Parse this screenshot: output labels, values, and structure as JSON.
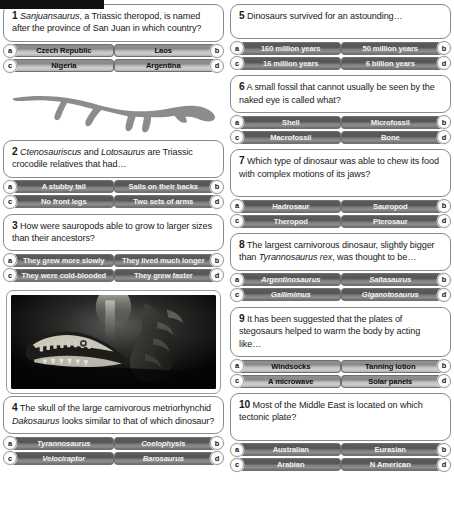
{
  "meta": {
    "accent_dark": "#5c5c5c",
    "accent_light": "#b3b3b3",
    "card_border": "#8a8a8a",
    "silhouette_color": "#8c8c8c"
  },
  "media": {
    "silhouette_alt": "dinosaur-silhouette",
    "photo_alt": "marine-reptile-skull-photo"
  },
  "columns": [
    {
      "id": "left",
      "items": [
        {
          "kind": "question",
          "number": "1",
          "text_parts": [
            {
              "t": "Sanjuansaurus",
              "i": true
            },
            {
              "t": ", a Triassic theropod, is named after the province of San Juan in which country?",
              "i": false
            }
          ],
          "style": "light",
          "answers": [
            {
              "key": "a",
              "label": "Czech Republic"
            },
            {
              "key": "b",
              "label": "Laos"
            },
            {
              "key": "c",
              "label": "Nigeria"
            },
            {
              "key": "d",
              "label": "Argentina"
            }
          ]
        },
        {
          "kind": "silhouette"
        },
        {
          "kind": "question",
          "number": "2",
          "text_parts": [
            {
              "t": "Ctenosauriscus",
              "i": true
            },
            {
              "t": " and ",
              "i": false
            },
            {
              "t": "Lotosaurus",
              "i": true
            },
            {
              "t": " are Triassic crocodile relatives that had…",
              "i": false
            }
          ],
          "style": "dark",
          "answers": [
            {
              "key": "a",
              "label": "A stubby tail"
            },
            {
              "key": "b",
              "label": "Sails on their backs"
            },
            {
              "key": "c",
              "label": "No front legs"
            },
            {
              "key": "d",
              "label": "Two sets of arms"
            }
          ]
        },
        {
          "kind": "question",
          "number": "3",
          "text_parts": [
            {
              "t": "How were sauropods able to grow to larger sizes than their ancestors?",
              "i": false
            }
          ],
          "style": "dark",
          "answers": [
            {
              "key": "a",
              "label": "They grew more slowly"
            },
            {
              "key": "b",
              "label": "They lived much longer"
            },
            {
              "key": "c",
              "label": "They were cold-blooded"
            },
            {
              "key": "d",
              "label": "They grew faster"
            }
          ]
        },
        {
          "kind": "photo"
        },
        {
          "kind": "question",
          "number": "4",
          "text_parts": [
            {
              "t": "The skull of the large carnivorous metriorhynchid ",
              "i": false
            },
            {
              "t": "Dakosaurus",
              "i": true
            },
            {
              "t": " looks similar to that of which dinosaur?",
              "i": false
            }
          ],
          "style": "dark",
          "italic_answers": true,
          "answers": [
            {
              "key": "a",
              "label": "Tyrannosaurus"
            },
            {
              "key": "b",
              "label": "Coelophysis"
            },
            {
              "key": "c",
              "label": "Velociraptor"
            },
            {
              "key": "d",
              "label": "Barosaurus"
            }
          ]
        }
      ]
    },
    {
      "id": "right",
      "items": [
        {
          "kind": "question",
          "number": "5",
          "text_parts": [
            {
              "t": "Dinosaurs survived for an astounding…",
              "i": false
            }
          ],
          "style": "dark",
          "tall": true,
          "answers": [
            {
              "key": "a",
              "label": "160 million years"
            },
            {
              "key": "b",
              "label": "50 million years"
            },
            {
              "key": "c",
              "label": "16 million years"
            },
            {
              "key": "d",
              "label": "6 billion years"
            }
          ]
        },
        {
          "kind": "question",
          "number": "6",
          "text_parts": [
            {
              "t": "A small fossil that cannot usually be seen by the naked eye is called what?",
              "i": false
            }
          ],
          "style": "dark",
          "answers": [
            {
              "key": "a",
              "label": "Shell"
            },
            {
              "key": "b",
              "label": "Microfossil"
            },
            {
              "key": "c",
              "label": "Macrofossil"
            },
            {
              "key": "d",
              "label": "Bone"
            }
          ]
        },
        {
          "kind": "question",
          "number": "7",
          "text_parts": [
            {
              "t": "Which type of dinosaur was able to chew its food with complex motions of its jaws?",
              "i": false
            }
          ],
          "style": "dark",
          "tall": true,
          "answers": [
            {
              "key": "a",
              "label": "Hadrosaur"
            },
            {
              "key": "b",
              "label": "Sauropod"
            },
            {
              "key": "c",
              "label": "Theropod"
            },
            {
              "key": "d",
              "label": "Pterosaur"
            }
          ]
        },
        {
          "kind": "question",
          "number": "8",
          "text_parts": [
            {
              "t": "The largest carnivorous dinosaur, slightly bigger than ",
              "i": false
            },
            {
              "t": "Tyrannosaurus rex",
              "i": true
            },
            {
              "t": ", was thought to be…",
              "i": false
            }
          ],
          "style": "dark",
          "italic_answers": true,
          "answers": [
            {
              "key": "a",
              "label": "Argentinosaurus"
            },
            {
              "key": "b",
              "label": "Saltasaurus"
            },
            {
              "key": "c",
              "label": "Gallimimus"
            },
            {
              "key": "d",
              "label": "Giganotosaurus"
            }
          ]
        },
        {
          "kind": "question",
          "number": "9",
          "text_parts": [
            {
              "t": "It has been suggested that the plates of stegosaurs helped to warm the body by acting like…",
              "i": false
            }
          ],
          "style": "light",
          "answers": [
            {
              "key": "a",
              "label": "Windsocks"
            },
            {
              "key": "b",
              "label": "Tanning lotion"
            },
            {
              "key": "c",
              "label": "A microwave"
            },
            {
              "key": "d",
              "label": "Solar panels"
            }
          ]
        },
        {
          "kind": "question",
          "number": "10",
          "text_parts": [
            {
              "t": "Most of the Middle East is located on which tectonic plate?",
              "i": false
            }
          ],
          "style": "dark",
          "tall": true,
          "answers": [
            {
              "key": "a",
              "label": "Australian"
            },
            {
              "key": "b",
              "label": "Eurasian"
            },
            {
              "key": "c",
              "label": "Arabian"
            },
            {
              "key": "d",
              "label": "N American"
            }
          ]
        }
      ]
    }
  ]
}
